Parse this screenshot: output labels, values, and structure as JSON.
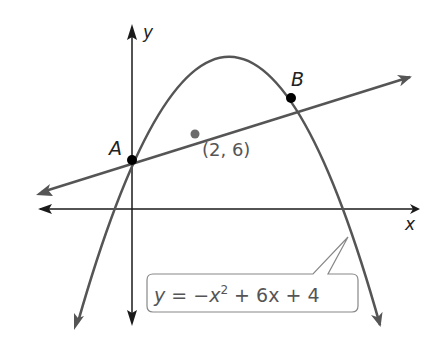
{
  "figure": {
    "axes": {
      "x_label": "x",
      "y_label": "y"
    },
    "points": [
      {
        "name": "A",
        "label": "A",
        "x": 0,
        "y": 4
      },
      {
        "name": "B",
        "label": "B",
        "x": 5,
        "y": 9
      },
      {
        "name": "given",
        "label": "(2, 6)",
        "x": 2,
        "y": 6
      }
    ],
    "curves": [
      {
        "type": "parabola",
        "equation": "y = −x² + 6x + 4",
        "vertex": [
          3,
          13
        ]
      },
      {
        "type": "line",
        "equation": "y = x + 4",
        "through": [
          [
            0,
            4
          ],
          [
            2,
            6
          ]
        ]
      }
    ],
    "callout": {
      "prefix": "y = −x",
      "sup": "2",
      "suffix": " + 6x + 4"
    },
    "colors": {
      "axis": "#1a1a1a",
      "curve": "#555555",
      "point": "#000000",
      "given_point": "#6b6b6b"
    }
  }
}
